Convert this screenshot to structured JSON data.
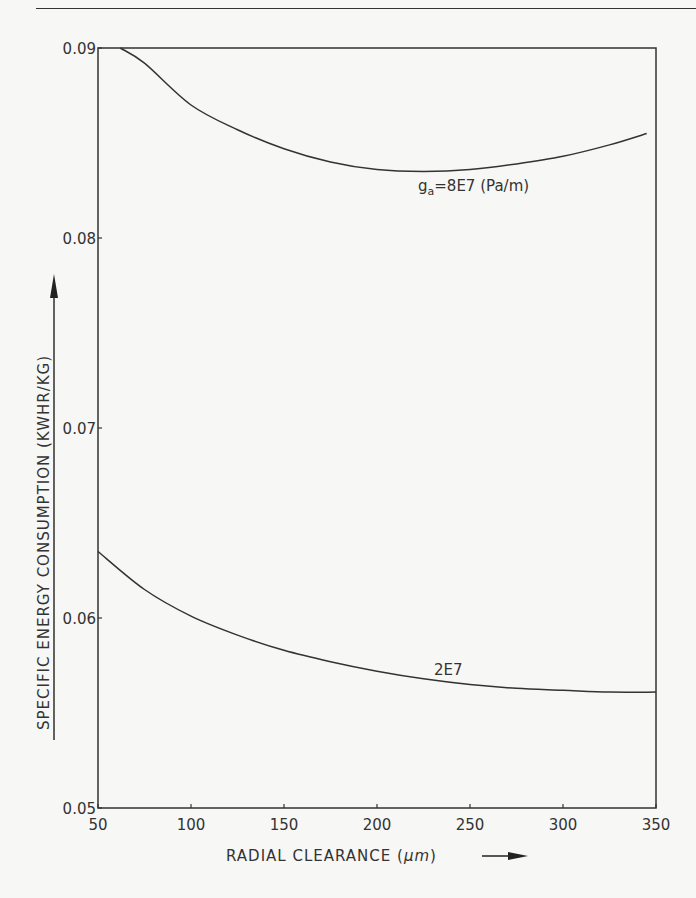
{
  "chart_data": {
    "type": "line",
    "title": "",
    "xlabel": "RADIAL CLEARANCE (μm)",
    "ylabel": "SPECIFIC ENERGY CONSUMPTION (KWHR/KG)",
    "xlim": [
      50,
      350
    ],
    "ylim": [
      0.05,
      0.09
    ],
    "x_ticks": [
      50,
      100,
      150,
      200,
      250,
      300,
      350
    ],
    "y_ticks": [
      "0.05",
      "0.06",
      "0.07",
      "0.08",
      "0.09"
    ],
    "grid": false,
    "legend": "inline labels",
    "series": [
      {
        "name": "g_a=8E7 (Pa/m)",
        "label_main": "g",
        "label_sub": "a",
        "label_rest": "=8E7 (Pa/m)",
        "x": [
          62,
          75,
          100,
          125,
          150,
          175,
          200,
          225,
          250,
          275,
          300,
          325,
          345
        ],
        "values": [
          0.09,
          0.0892,
          0.087,
          0.0857,
          0.0847,
          0.084,
          0.0836,
          0.0835,
          0.0836,
          0.0839,
          0.0843,
          0.0849,
          0.0855
        ]
      },
      {
        "name": "2E7",
        "label_main": "2E7",
        "x": [
          50,
          75,
          100,
          125,
          150,
          175,
          200,
          225,
          250,
          275,
          300,
          325,
          350
        ],
        "values": [
          0.0635,
          0.0615,
          0.0601,
          0.0591,
          0.0583,
          0.0577,
          0.0572,
          0.0568,
          0.0565,
          0.0563,
          0.0562,
          0.0561,
          0.0561
        ]
      }
    ]
  },
  "axes": {
    "x_title_text": "RADIAL  CLEARANCE  (",
    "x_title_unit": "μm",
    "x_title_close": ")",
    "y_title_text": "SPECIFIC  ENERGY  CONSUMPTION  (KWHR/KG)"
  }
}
